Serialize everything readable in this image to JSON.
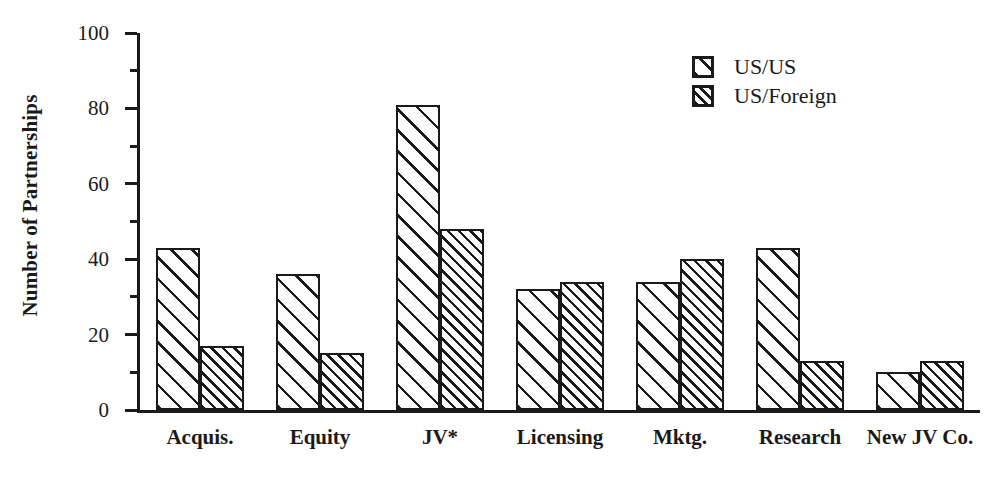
{
  "chart_data": {
    "type": "bar",
    "title": "",
    "subtitle": "",
    "xlabel": "",
    "ylabel": "Number of Partnerships",
    "ylim": [
      0,
      100
    ],
    "y_major_ticks": [
      0,
      20,
      40,
      60,
      80,
      100
    ],
    "y_minor_ticks": [
      10,
      30,
      50,
      70,
      90
    ],
    "y_tick_labels": [
      "0",
      "20",
      "40",
      "60",
      "80",
      "100"
    ],
    "grid": false,
    "legend_position": "top-right",
    "categories": [
      "Acquis.",
      "Equity",
      "JV*",
      "Licensing",
      "Mktg.",
      "Research",
      "New JV Co."
    ],
    "series": [
      {
        "name": "US/US",
        "pattern": "wide-diagonal-hatch",
        "values": [
          43,
          36,
          81,
          32,
          34,
          43,
          10
        ]
      },
      {
        "name": "US/Foreign",
        "pattern": "dense-diagonal-hatch",
        "values": [
          17,
          15,
          48,
          34,
          40,
          13,
          13
        ]
      }
    ],
    "annotations": []
  },
  "legend": {
    "items": [
      {
        "label": "US/US",
        "swatch": "wide-hatch-swatch"
      },
      {
        "label": "US/Foreign",
        "swatch": "dense-hatch-swatch"
      }
    ]
  },
  "colors": {
    "ink": "#1a1a1a",
    "background": "#ffffff",
    "bar_fill": "#fdfdfd"
  }
}
